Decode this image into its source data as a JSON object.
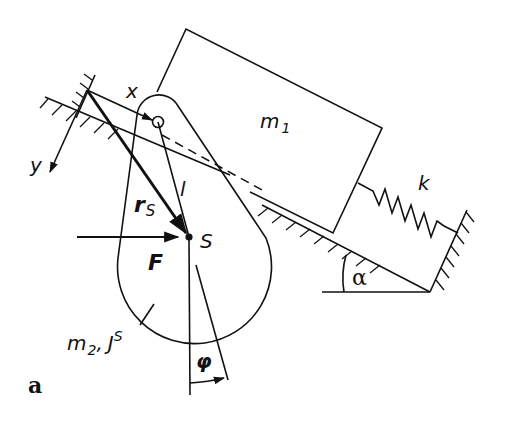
{
  "figure": {
    "panel_label": "a"
  },
  "labels": {
    "x_axis": "x",
    "y_axis": "y",
    "block_mass": "m",
    "block_mass_sub": "1",
    "spring": "k",
    "pendulum_length": "l",
    "position_vector": "r",
    "position_vector_sub": "S",
    "center_of_mass": "S",
    "force": "F",
    "pendulum_mass": "m",
    "pendulum_mass_sub": "2",
    "pendulum_inertia": "J",
    "pendulum_inertia_sup": "S",
    "separator": ",",
    "angle_phi": "φ",
    "angle_alpha": "α"
  },
  "colors": {
    "ink": "#111111",
    "background": "#ffffff"
  }
}
